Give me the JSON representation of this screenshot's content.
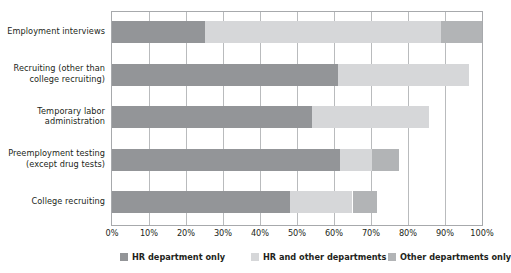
{
  "chart_data": {
    "type": "bar",
    "orientation": "horizontal",
    "stacked": true,
    "title": "",
    "xlabel": "",
    "ylabel": "",
    "xlim": [
      0,
      100
    ],
    "xticks": [
      "0%",
      "10%",
      "20%",
      "30%",
      "40%",
      "50%",
      "60%",
      "70%",
      "80%",
      "90%",
      "100%"
    ],
    "grid": true,
    "legend_position": "bottom",
    "categories": [
      "Employment interviews",
      "Recruiting (other than\ncollege recruiting)",
      "Temporary labor\nadministration",
      "Preemployment testing\n(except drug tests)",
      "College recruiting"
    ],
    "series": [
      {
        "name": "HR department only",
        "color": "#939598",
        "values": [
          25,
          61,
          54,
          61.5,
          48
        ]
      },
      {
        "name": "HR and other departments",
        "color": "#d6d7d9",
        "values": [
          64,
          35.5,
          31.7,
          8.9,
          17
        ]
      },
      {
        "name": "Other departments only",
        "color": "#b2b4b6",
        "values": [
          11,
          0,
          0,
          7.3,
          6.7
        ]
      }
    ],
    "totals": [
      100,
      96.5,
      85.7,
      77.7,
      71.7
    ]
  },
  "axis": {
    "ticks": [
      {
        "label": "0%",
        "value": 0
      },
      {
        "label": "10%",
        "value": 10
      },
      {
        "label": "20%",
        "value": 20
      },
      {
        "label": "30%",
        "value": 30
      },
      {
        "label": "40%",
        "value": 40
      },
      {
        "label": "50%",
        "value": 50
      },
      {
        "label": "60%",
        "value": 60
      },
      {
        "label": "70%",
        "value": 70
      },
      {
        "label": "80%",
        "value": 80
      },
      {
        "label": "90%",
        "value": 90
      },
      {
        "label": "100%",
        "value": 100
      }
    ]
  },
  "legend": {
    "items": [
      {
        "label": "HR department only",
        "color": "#939598"
      },
      {
        "label": "HR and other departments",
        "color": "#d6d7d9"
      },
      {
        "label": "Other departments only",
        "color": "#b2b4b6"
      }
    ]
  }
}
